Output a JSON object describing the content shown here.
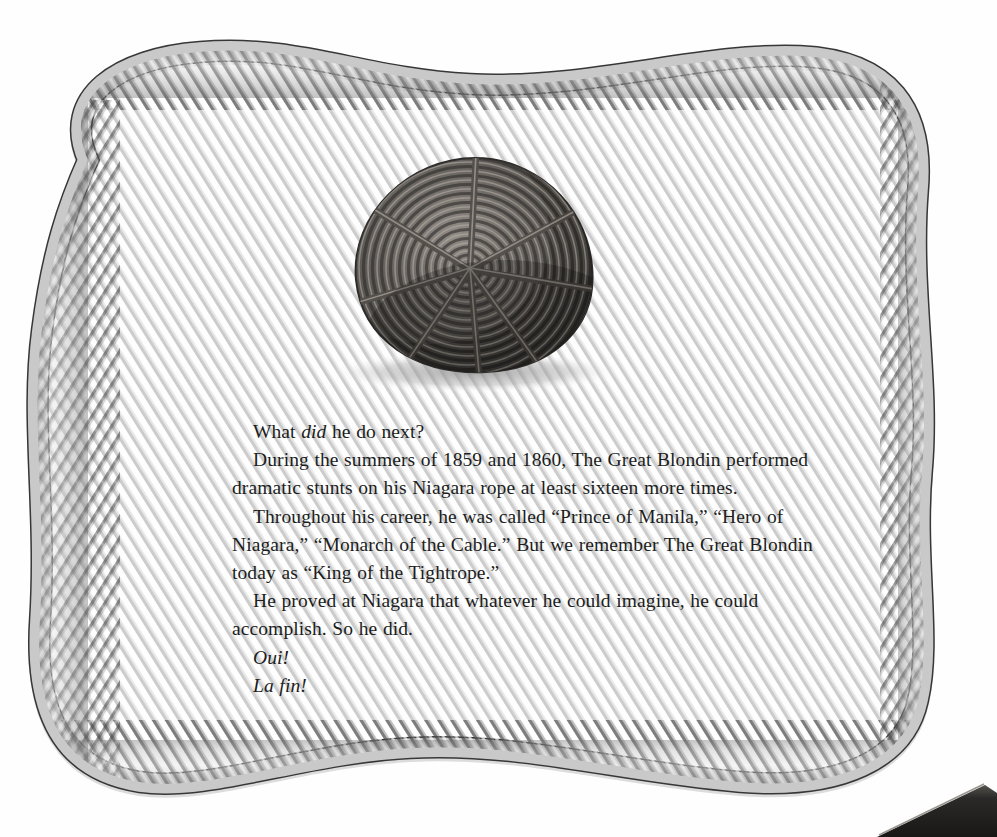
{
  "page": {
    "kind": "picture-book-page",
    "background_color": "#fefefe",
    "width": 997,
    "height": 837
  },
  "decor": {
    "border": {
      "name": "rope-border-frame",
      "description": "hand-drawn twisted three-strand rope forming a wavy rectangular frame around the page",
      "rope_light": "#d9d9d9",
      "rope_mid": "#a8a8a8",
      "rope_dark": "#5e5e5e",
      "rope_outline": "#3a3a3a",
      "thickness_px": 19
    },
    "illustration": {
      "name": "coiled-rope-illustration",
      "description": "a large bundle of dark rope coiled in a flat spiral and bound with radial lashings, casting a soft shadow",
      "coil_dark": "#3b3936",
      "coil_mid": "#6b6762",
      "coil_light": "#a6a09a",
      "shadow_color": "#9a9a9a"
    },
    "book_edge": {
      "name": "book-edge-corner",
      "description": "dark angled edge of an adjacent book page intruding at the bottom-right corner",
      "color": "#2b2a28"
    }
  },
  "text": {
    "paragraphs": [
      {
        "id": "p1",
        "runs": [
          {
            "text": "What ",
            "style": "roman"
          },
          {
            "text": "did",
            "style": "italic"
          },
          {
            "text": " he do next?",
            "style": "roman"
          }
        ],
        "plain": "What did he do next?"
      },
      {
        "id": "p2",
        "runs": [
          {
            "text": "During the summers of 1859 and 1860, The Great Blondin performed dramatic stunts on his Niagara rope at least sixteen more times.",
            "style": "roman"
          }
        ],
        "plain": "During the summers of 1859 and 1860, The Great Blondin performed dramatic stunts on his Niagara rope at least sixteen more times."
      },
      {
        "id": "p3",
        "runs": [
          {
            "text": "Throughout his career, he was called “Prince of Manila,” “Hero of Niagara,” “Monarch of the Cable.” But we remember The Great Blondin today as “King of the Tightrope.”",
            "style": "roman"
          }
        ],
        "plain": "Throughout his career, he was called “Prince of Manila,” “Hero of Niagara,” “Monarch of the Cable.” But we remember The Great Blondin today as “King of the Tightrope.”"
      },
      {
        "id": "p4",
        "runs": [
          {
            "text": "He proved at Niagara that whatever he could imagine, he could accomplish. So he did.",
            "style": "roman"
          }
        ],
        "plain": "He proved at Niagara that whatever he could imagine, he could accomplish. So he did."
      },
      {
        "id": "p5",
        "runs": [
          {
            "text": "Oui!",
            "style": "italic"
          }
        ],
        "plain": "Oui!"
      },
      {
        "id": "p6",
        "runs": [
          {
            "text": "La fin!",
            "style": "italic"
          }
        ],
        "plain": "La fin!"
      }
    ],
    "line1_a": "What ",
    "line1_b": "did",
    "line1_c": " he do next?",
    "line2": "During the summers of 1859 and 1860, The Great Blondin performed",
    "line3": "dramatic stunts on his Niagara rope at least sixteen more times.",
    "line4": "Throughout his career, he was called “Prince of Manila,” “Hero of",
    "line5": "Niagara,” “Monarch of the Cable.” But we remember The Great Blondin today",
    "line6": "as “King of the Tightrope.”",
    "line7": "He proved at Niagara that whatever he could imagine, he could accomplish.",
    "line8": "So he did.",
    "line9": "Oui!",
    "line10": "La fin!",
    "color": "#201d1c"
  }
}
